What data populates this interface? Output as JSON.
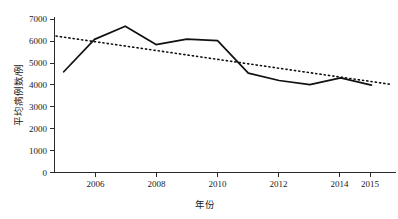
{
  "chart_data": {
    "type": "line",
    "title": "",
    "subtitle": "",
    "xlabel": "年份",
    "ylabel": "平均病例数/例",
    "x": [
      2005,
      2006,
      2007,
      2008,
      2009,
      2010,
      2011,
      2012,
      2013,
      2014,
      2015
    ],
    "xticklabels": [
      "2006",
      "2008",
      "2010",
      "2012",
      "2014",
      "2015"
    ],
    "xtickvalues": [
      2006,
      2008,
      2010,
      2012,
      2014,
      2015
    ],
    "xlim": [
      2004.7,
      2015.8
    ],
    "yticklabels": [
      "0",
      "1000",
      "2000",
      "3000",
      "4000",
      "5000",
      "6000",
      "7000"
    ],
    "ytickvalues": [
      0,
      1000,
      2000,
      3000,
      4000,
      5000,
      6000,
      7000
    ],
    "ylim": [
      0,
      7150
    ],
    "grid": false,
    "legend": "none",
    "series": [
      {
        "name": "平均病例数",
        "style": "solid",
        "color": "#111111",
        "values": [
          4600,
          6080,
          6680,
          5840,
          6090,
          6020,
          4540,
          4200,
          4010,
          4320,
          3990
        ]
      },
      {
        "name": "线性趋势线",
        "style": "dotted",
        "color": "#111111",
        "x": [
          2004.75,
          2015.65
        ],
        "values": [
          6230,
          4020
        ]
      }
    ]
  },
  "axes": {
    "y_axis_name": "y-axis",
    "x_axis_name": "x-axis"
  }
}
